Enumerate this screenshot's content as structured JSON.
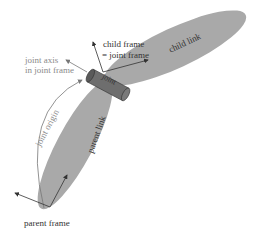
{
  "diagram": {
    "labels": {
      "child_frame_line1": "child frame",
      "child_frame_line2": "= joint frame",
      "joint_axis_line1": "joint axis",
      "joint_axis_line2": "in joint frame",
      "joint": "joint",
      "child_link": "child link",
      "parent_link": "parent link",
      "joint_origin": "joint origin",
      "parent_frame": "parent frame"
    },
    "colors": {
      "link_fill": "#a9a9a9",
      "joint_fill": "#6e6e6e",
      "arrow": "#333333",
      "gray_text": "#8a8a8a",
      "dark_text": "#333333"
    }
  }
}
